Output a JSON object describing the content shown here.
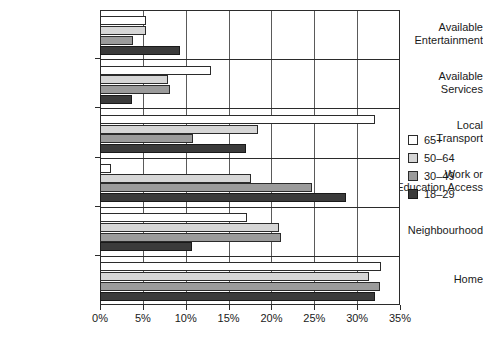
{
  "chart_data": {
    "type": "bar",
    "orientation": "horizontal",
    "title": "",
    "subtitle": "",
    "xlabel": "",
    "ylabel": "",
    "xlim": [
      0,
      35
    ],
    "xtick_labels": [
      "0%",
      "5%",
      "10%",
      "15%",
      "20%",
      "25%",
      "30%",
      "35%"
    ],
    "xtick_values": [
      0,
      5,
      10,
      15,
      20,
      25,
      30,
      35
    ],
    "grid": true,
    "grid_axis": "x",
    "legend_position": "right",
    "categories": [
      "Available\nEntertainment",
      "Available\nServices",
      "Local\nTransport",
      "Work or\nEducation Access",
      "Neighbourhood",
      "Home"
    ],
    "series": [
      {
        "name": "65+",
        "color": "#ffffff",
        "values": [
          5.2,
          12.8,
          32.0,
          1.2,
          17.0,
          32.7
        ]
      },
      {
        "name": "50–64",
        "color": "#d6d6d6",
        "values": [
          5.2,
          7.8,
          18.3,
          17.5,
          20.8,
          31.3
        ]
      },
      {
        "name": "30–49",
        "color": "#9b9b9b",
        "values": [
          3.7,
          8.0,
          10.7,
          24.6,
          21.0,
          32.5
        ]
      },
      {
        "name": "18–29",
        "color": "#3b3b3b",
        "values": [
          9.2,
          3.6,
          16.9,
          28.6,
          10.6,
          32.0
        ]
      }
    ]
  },
  "legend": {
    "items": [
      {
        "label": "65+"
      },
      {
        "label": "50–64"
      },
      {
        "label": "30–49"
      },
      {
        "label": "18–29"
      }
    ]
  }
}
